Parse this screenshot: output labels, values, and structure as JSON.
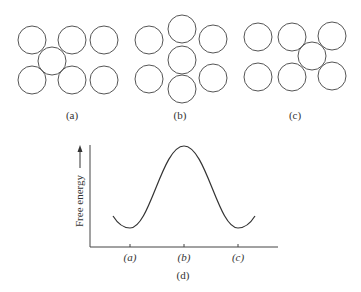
{
  "panels": [
    {
      "label": "(a)",
      "circles": [
        [
          32,
          40
        ],
        [
          72,
          40
        ],
        [
          104,
          40
        ],
        [
          52,
          61
        ],
        [
          32,
          80
        ],
        [
          72,
          80
        ],
        [
          104,
          80
        ]
      ]
    },
    {
      "label": "(b)",
      "circles": [
        [
          149,
          40
        ],
        [
          182,
          29
        ],
        [
          213,
          39
        ],
        [
          182,
          60
        ],
        [
          149,
          79
        ],
        [
          182,
          89
        ],
        [
          213,
          78
        ]
      ]
    },
    {
      "label": "(c)",
      "circles": [
        [
          258,
          37
        ],
        [
          292,
          37
        ],
        [
          332,
          36
        ],
        [
          312,
          56
        ],
        [
          258,
          77
        ],
        [
          292,
          77
        ],
        [
          332,
          76
        ]
      ]
    }
  ],
  "circle_radius": 14,
  "chart": {
    "label": "(d)",
    "ylabel": "Free energy",
    "ticks": [
      "(a)",
      "(b)",
      "(c)"
    ]
  },
  "chart_data": {
    "type": "line",
    "title": "",
    "xlabel": "",
    "ylabel": "Free energy",
    "categories": [
      "(a)",
      "(b)",
      "(c)"
    ],
    "series": [
      {
        "name": "Free energy profile",
        "values": [
          0.15,
          1.0,
          0.15
        ]
      }
    ],
    "grid": false
  }
}
